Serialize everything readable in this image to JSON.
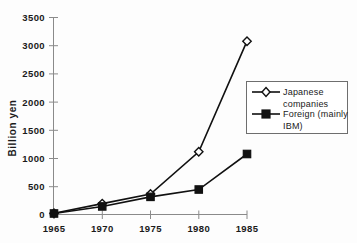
{
  "chart_data": {
    "type": "line",
    "title": "",
    "xlabel": "",
    "ylabel": "Billion  yen",
    "categories": [
      "1965",
      "1970",
      "1975",
      "1980",
      "1985"
    ],
    "x": [
      1965,
      1970,
      1975,
      1980,
      1985
    ],
    "xlim": [
      1965,
      1985
    ],
    "ylim": [
      0,
      3500
    ],
    "ytick_labels": [
      "0",
      "500",
      "1000",
      "1500",
      "2000",
      "2500",
      "3000",
      "3500"
    ],
    "yticks": [
      0,
      500,
      1000,
      1500,
      2000,
      2500,
      3000,
      3500
    ],
    "grid": false,
    "legend_position": "right",
    "series": [
      {
        "name": "Japanese companies",
        "legend_label_line1": "Japanese",
        "legend_label_line2": "companies",
        "marker": "open-diamond",
        "color": "#111111",
        "values": [
          30,
          200,
          370,
          1120,
          3080
        ]
      },
      {
        "name": "Foreign (mainly IBM)",
        "legend_label_line1": "Foreign  (mainly",
        "legend_label_line2": "IBM)",
        "marker": "filled-square",
        "color": "#111111",
        "values": [
          25,
          150,
          320,
          450,
          1080
        ]
      }
    ]
  },
  "axis": {
    "y_title": "Billion  yen",
    "y_ticks": [
      "3500",
      "3000",
      "2500",
      "2000",
      "1500",
      "1000",
      "500",
      "0"
    ],
    "x_ticks": [
      "1965",
      "1970",
      "1975",
      "1980",
      "1985"
    ]
  },
  "legend": {
    "entry1_line1": "Japanese",
    "entry1_line2": "companies",
    "entry2_line1": "Foreign  (mainly",
    "entry2_line2": "IBM)"
  }
}
